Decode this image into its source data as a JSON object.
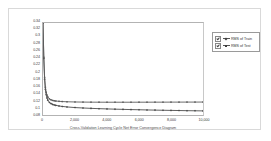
{
  "chart_data": {
    "type": "line",
    "title": "",
    "caption": "Cross-Validation Learning Cycle Net Error Convergence Diagram",
    "xlabel": "",
    "ylabel": "",
    "xlim": [
      0,
      10000
    ],
    "ylim": [
      0.08,
      0.34
    ],
    "grid": false,
    "legend_position": "right-outside",
    "x_ticks": [
      {
        "value": 0,
        "label": "0"
      },
      {
        "value": 2000,
        "label": "2,000"
      },
      {
        "value": 4000,
        "label": "4,000"
      },
      {
        "value": 6000,
        "label": "6,000"
      },
      {
        "value": 8000,
        "label": "8,000"
      },
      {
        "value": 10000,
        "label": "10,000"
      }
    ],
    "y_ticks": [
      {
        "value": 0.34,
        "label": "0.34"
      },
      {
        "value": 0.32,
        "label": "0.32"
      },
      {
        "value": 0.3,
        "label": "0.3"
      },
      {
        "value": 0.28,
        "label": "0.28"
      },
      {
        "value": 0.26,
        "label": "0.26"
      },
      {
        "value": 0.24,
        "label": "0.24"
      },
      {
        "value": 0.22,
        "label": "0.22"
      },
      {
        "value": 0.2,
        "label": "0.2"
      },
      {
        "value": 0.18,
        "label": "0.18"
      },
      {
        "value": 0.16,
        "label": "0.16"
      },
      {
        "value": 0.14,
        "label": "0.14"
      },
      {
        "value": 0.12,
        "label": "0.12"
      },
      {
        "value": 0.1,
        "label": "0.1"
      },
      {
        "value": 0.08,
        "label": "0.08"
      }
    ],
    "x": [
      0,
      50,
      100,
      150,
      200,
      250,
      300,
      400,
      500,
      600,
      700,
      800,
      1000,
      1200,
      1500,
      2000,
      2500,
      3000,
      3500,
      4000,
      4500,
      5000,
      5500,
      6000,
      6500,
      7000,
      7500,
      8000,
      8500,
      9000,
      9500,
      10000
    ],
    "series": [
      {
        "name": "RMS of Train",
        "color": "#4a4a4a",
        "marker": "diamond",
        "values": [
          0.341,
          0.24,
          0.181,
          0.152,
          0.137,
          0.128,
          0.122,
          0.1155,
          0.1122,
          0.11,
          0.1085,
          0.1073,
          0.1055,
          0.1042,
          0.1028,
          0.101,
          0.0998,
          0.0988,
          0.0979,
          0.0972,
          0.0965,
          0.0959,
          0.0953,
          0.0948,
          0.0943,
          0.0938,
          0.0934,
          0.093,
          0.0926,
          0.0922,
          0.0919,
          0.0916
        ]
      },
      {
        "name": "RMS of Test",
        "color": "#5a5a5a",
        "marker": "square",
        "values": [
          0.34,
          0.243,
          0.186,
          0.158,
          0.144,
          0.136,
          0.131,
          0.1255,
          0.1228,
          0.1212,
          0.1202,
          0.1195,
          0.1186,
          0.118,
          0.1174,
          0.1168,
          0.1165,
          0.1163,
          0.1162,
          0.1161,
          0.1161,
          0.1161,
          0.1161,
          0.1162,
          0.1162,
          0.1163,
          0.1163,
          0.1164,
          0.1164,
          0.1165,
          0.1165,
          0.1166
        ]
      }
    ]
  },
  "legend": {
    "items": [
      {
        "label": "RMS of Train",
        "checked": true,
        "marker": "diamond"
      },
      {
        "label": "RMS of Test",
        "checked": true,
        "marker": "square"
      }
    ]
  }
}
